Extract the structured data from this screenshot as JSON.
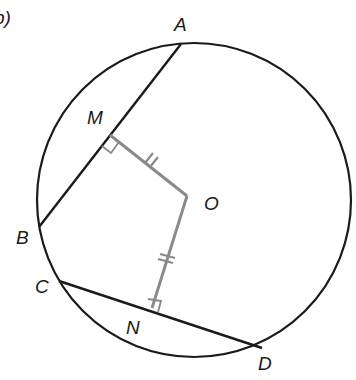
{
  "diagram": {
    "partial_label": "b)",
    "labels": {
      "A": "A",
      "B": "B",
      "C": "C",
      "D": "D",
      "M": "M",
      "N": "N",
      "O": "O"
    },
    "colors": {
      "circle": "#1a1a1a",
      "chord": "#1a1a1a",
      "perpendicular": "#8a8a8a",
      "background": "#ffffff"
    },
    "elements": {
      "circle": "circle centered at O",
      "chords": [
        "AB",
        "CD"
      ],
      "perpendiculars": [
        "OM",
        "ON"
      ],
      "right_angles": [
        "M",
        "N"
      ],
      "equal_marks": "OM = ON (double tick marks)"
    }
  }
}
